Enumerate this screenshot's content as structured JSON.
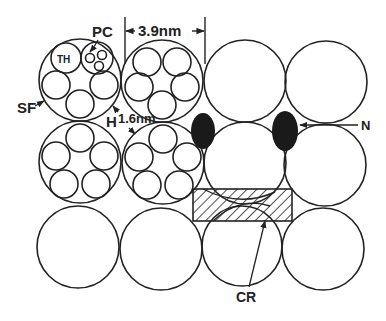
{
  "diagram": {
    "type": "schematic cross-section of packed fibres",
    "labels": {
      "pc": "PC",
      "th": "TH",
      "sf": "SF",
      "h": "H",
      "spacing_small": "1.6nm",
      "spacing_large": "3.9nm",
      "n": "N",
      "cr": "CR"
    },
    "colors": {
      "stroke": "#222222",
      "fill_dark": "#1a1a1a",
      "background": "#ffffff"
    },
    "grid": {
      "rows": 3,
      "columns": 4
    }
  }
}
